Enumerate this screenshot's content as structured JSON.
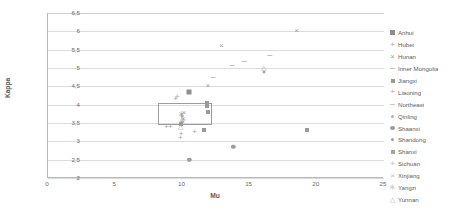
{
  "chart_data": {
    "type": "scatter",
    "title": "",
    "xlabel": "Mu",
    "ylabel": "Kappa",
    "xlim": [
      0,
      25
    ],
    "ylim": [
      2,
      6.5
    ],
    "xticks": [
      "0",
      "5",
      "10",
      "15",
      "20",
      "25"
    ],
    "xtick_values": [
      0,
      5,
      10,
      15,
      20,
      25
    ],
    "yticks": [
      "2",
      "2,5",
      "3",
      "3,5",
      "4",
      "4,5",
      "5",
      "5,5",
      "6",
      "6,5"
    ],
    "ytick_values": [
      2,
      2.5,
      3,
      3.5,
      4,
      4.5,
      5,
      5.5,
      6,
      6.5
    ],
    "grid": "horizontal",
    "legend_position": "right",
    "decimal_separator": ",",
    "annotation_box": {
      "x0": 8.2,
      "y0": 3.45,
      "x1": 12.2,
      "y1": 4.05,
      "stroke": "#9d9d9d"
    },
    "series": [
      {
        "name": "Anhui",
        "marker": "square",
        "color": "#8e8e8e",
        "points": [
          [
            10.5,
            4.35
          ]
        ]
      },
      {
        "name": "Hubei",
        "marker": "plus",
        "color": "#a4a4a4",
        "points": [
          [
            10.9,
            3.25
          ],
          [
            9.9,
            3.15
          ]
        ]
      },
      {
        "name": "Hunan",
        "marker": "x",
        "color": "#9b9b9b",
        "points": [
          [
            12.9,
            5.6
          ],
          [
            18.5,
            6.0
          ],
          [
            11.9,
            4.5
          ]
        ]
      },
      {
        "name": "Inner Mongolia",
        "marker": "dash",
        "color": "#a5a5a5",
        "points": [
          [
            14.6,
            5.2
          ],
          [
            13.7,
            5.07
          ],
          [
            16.5,
            5.35
          ]
        ]
      },
      {
        "name": "Jiangxi",
        "marker": "square-small",
        "color": "#9a9a9a",
        "points": [
          [
            11.9,
            3.8
          ],
          [
            11.8,
            4.05
          ],
          [
            19.3,
            3.3
          ],
          [
            11.6,
            3.3
          ]
        ]
      },
      {
        "name": "Liaoning",
        "marker": "plus-small",
        "color": "#aaaaaa",
        "points": [
          [
            9.6,
            4.2
          ],
          [
            9.5,
            4.15
          ]
        ]
      },
      {
        "name": "Northeast",
        "marker": "dash-small",
        "color": "#b0b0b0",
        "points": [
          [
            12.3,
            4.75
          ],
          [
            13.0,
            5.05
          ]
        ]
      },
      {
        "name": "Qinling",
        "marker": "dot",
        "color": "#b2b2b2",
        "points": [
          [
            16.1,
            4.88
          ],
          [
            16.0,
            5.02
          ]
        ]
      },
      {
        "name": "Shaanxi",
        "marker": "circle",
        "color": "#9e9e9e",
        "points": [
          [
            10.5,
            2.5
          ],
          [
            13.8,
            2.85
          ]
        ]
      },
      {
        "name": "Shandong",
        "marker": "circle-small",
        "color": "#a0a0a0",
        "points": [
          [
            10.0,
            3.6
          ],
          [
            10.1,
            3.72
          ]
        ]
      },
      {
        "name": "Shanxi",
        "marker": "square-hatch",
        "color": "#a6a6a6",
        "points": [
          [
            9.9,
            3.55
          ],
          [
            9.8,
            3.45
          ]
        ]
      },
      {
        "name": "Sichuan",
        "marker": "plus-thin",
        "color": "#b4b4b4",
        "points": [
          [
            8.8,
            3.42
          ],
          [
            9.1,
            3.38
          ]
        ]
      },
      {
        "name": "Xinjiang",
        "marker": "x-thin",
        "color": "#bcbcbc",
        "points": [
          [
            9.7,
            3.65
          ],
          [
            10.0,
            3.78
          ]
        ]
      },
      {
        "name": "Yangzi",
        "marker": "star",
        "color": "#b8b8b8",
        "points": [
          [
            10.2,
            3.58
          ],
          [
            9.9,
            3.68
          ]
        ]
      },
      {
        "name": "Yunnan",
        "marker": "triangle",
        "color": "#b0b0b0",
        "points": [
          [
            9.95,
            3.5
          ],
          [
            10.05,
            3.62
          ],
          [
            9.85,
            3.75
          ]
        ]
      }
    ],
    "all_points": [
      {
        "mu": 18.5,
        "kappa": 6.0,
        "marker": "x"
      },
      {
        "mu": 12.9,
        "kappa": 5.6,
        "marker": "x"
      },
      {
        "mu": 16.5,
        "kappa": 5.35,
        "marker": "dash"
      },
      {
        "mu": 14.6,
        "kappa": 5.2,
        "marker": "dash"
      },
      {
        "mu": 13.7,
        "kappa": 5.07,
        "marker": "dash-small"
      },
      {
        "mu": 16.0,
        "kappa": 5.02,
        "marker": "triangle"
      },
      {
        "mu": 16.1,
        "kappa": 4.88,
        "marker": "dot"
      },
      {
        "mu": 12.3,
        "kappa": 4.75,
        "marker": "dash-small"
      },
      {
        "mu": 11.9,
        "kappa": 4.5,
        "marker": "x"
      },
      {
        "mu": 10.5,
        "kappa": 4.35,
        "marker": "square"
      },
      {
        "mu": 9.6,
        "kappa": 4.2,
        "marker": "plus-small"
      },
      {
        "mu": 9.5,
        "kappa": 4.15,
        "marker": "plus-small"
      },
      {
        "mu": 11.8,
        "kappa": 4.05,
        "marker": "square-small"
      },
      {
        "mu": 11.85,
        "kappa": 3.97,
        "marker": "square-small"
      },
      {
        "mu": 11.9,
        "kappa": 3.8,
        "marker": "square-small"
      },
      {
        "mu": 10.1,
        "kappa": 3.78,
        "marker": "x-thin"
      },
      {
        "mu": 9.9,
        "kappa": 3.72,
        "marker": "star"
      },
      {
        "mu": 10.0,
        "kappa": 3.68,
        "marker": "circle-small"
      },
      {
        "mu": 9.95,
        "kappa": 3.62,
        "marker": "triangle"
      },
      {
        "mu": 10.05,
        "kappa": 3.58,
        "marker": "star"
      },
      {
        "mu": 10.0,
        "kappa": 3.52,
        "marker": "circle-small"
      },
      {
        "mu": 9.9,
        "kappa": 3.48,
        "marker": "square-hatch"
      },
      {
        "mu": 9.85,
        "kappa": 3.42,
        "marker": "triangle"
      },
      {
        "mu": 9.1,
        "kappa": 3.4,
        "marker": "plus-thin"
      },
      {
        "mu": 8.8,
        "kappa": 3.38,
        "marker": "plus-thin"
      },
      {
        "mu": 10.9,
        "kappa": 3.25,
        "marker": "plus"
      },
      {
        "mu": 11.6,
        "kappa": 3.3,
        "marker": "square-small"
      },
      {
        "mu": 19.3,
        "kappa": 3.3,
        "marker": "square-small"
      },
      {
        "mu": 9.9,
        "kappa": 3.2,
        "marker": "plus"
      },
      {
        "mu": 9.85,
        "kappa": 3.08,
        "marker": "plus"
      },
      {
        "mu": 13.8,
        "kappa": 2.85,
        "marker": "circle"
      },
      {
        "mu": 10.5,
        "kappa": 2.5,
        "marker": "circle"
      }
    ]
  }
}
